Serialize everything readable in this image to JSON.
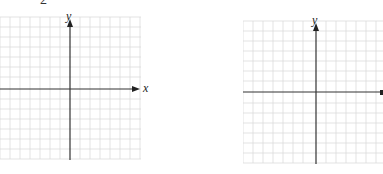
{
  "header": {
    "problem_number_fragment": "2"
  },
  "planes": [
    {
      "id": "left",
      "x_axis_label": "x",
      "y_axis_label": "y",
      "grid": {
        "cols": 14,
        "rows": 14,
        "cell_px": 10.1
      }
    },
    {
      "id": "right",
      "x_axis_label": "",
      "y_axis_label": "y",
      "grid": {
        "cols": 14,
        "rows": 14,
        "cell_px": 10.1
      }
    }
  ],
  "colors": {
    "grid": "#d9d9d9",
    "axis": "#333333",
    "background": "#ffffff"
  }
}
